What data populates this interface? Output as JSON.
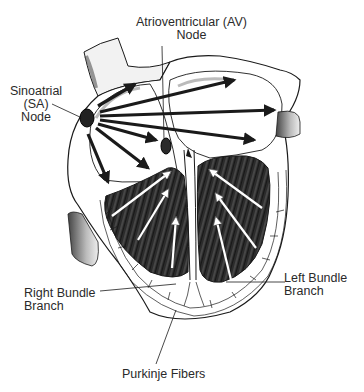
{
  "diagram": {
    "labels": {
      "av_node": {
        "line1": "Atrioventricular (AV)",
        "line2": "Node"
      },
      "sa_node": {
        "line1": "Sinoatrial",
        "line2": "(SA)",
        "line3": "Node"
      },
      "right_bundle": {
        "line1": "Right Bundle",
        "line2": "Branch"
      },
      "left_bundle": {
        "line1": "Left Bundle",
        "line2": "Branch"
      },
      "purkinje": {
        "line1": "Purkinje Fibers"
      }
    },
    "colors": {
      "ink": "#1a1a1a",
      "muscle": "#2b2b2b",
      "background": "#ffffff"
    }
  }
}
